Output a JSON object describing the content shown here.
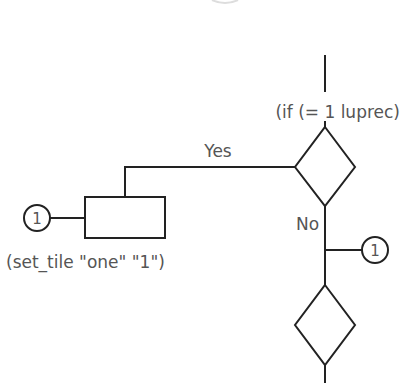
{
  "diagram": {
    "type": "flowchart",
    "colors": {
      "line": "#222222",
      "text": "#555555",
      "background": "#ffffff"
    },
    "decision_1": {
      "label": "(if (= 1 luprec)"
    },
    "yes_branch": {
      "label": "Yes"
    },
    "no_branch": {
      "label": "No"
    },
    "process_1": {
      "label": "(set_tile \"one\" \"1\")"
    },
    "connector_left": {
      "label": "1"
    },
    "connector_right": {
      "label": "1"
    },
    "decision_2": {
      "label": ""
    }
  }
}
